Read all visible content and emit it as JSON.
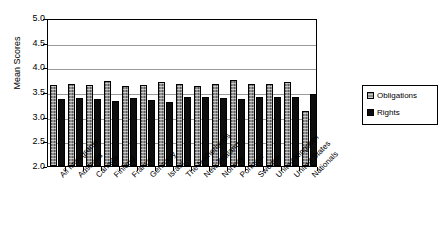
{
  "chart_data": {
    "type": "bar",
    "title": "",
    "xlabel": "",
    "ylabel": "Mean Scores",
    "ylim": [
      2.0,
      5.0
    ],
    "ytick_labels": [
      "5.0",
      "4.5",
      "4.0",
      "3.5",
      "3.0",
      "2.5",
      "2.0"
    ],
    "ytick_values": [
      5.0,
      4.5,
      4.0,
      3.5,
      3.0,
      2.5,
      2.0
    ],
    "grid": true,
    "legend_position": "right",
    "categories": [
      "All Immigrants",
      "Australia",
      "Canada",
      "Finland",
      "France",
      "Germany",
      "Israel",
      "The Netherlands",
      "New Zealand",
      "Norway",
      "Portugal",
      "Sweden",
      "United Kingdom",
      "United States",
      "Nationals"
    ],
    "series": [
      {
        "name": "Obligations",
        "color": "#8f8f8f",
        "values": [
          3.65,
          3.66,
          3.64,
          3.72,
          3.62,
          3.64,
          3.7,
          3.66,
          3.63,
          3.67,
          3.74,
          3.67,
          3.66,
          3.7,
          3.11
        ]
      },
      {
        "name": "Rights",
        "color": "#0d0d0d",
        "values": [
          3.35,
          3.37,
          3.35,
          3.32,
          3.38,
          3.34,
          3.3,
          3.39,
          3.39,
          3.38,
          3.35,
          3.39,
          3.39,
          3.39,
          3.45
        ]
      }
    ]
  },
  "legend": {
    "items": [
      {
        "label": "Obligations",
        "swatch": "obligations"
      },
      {
        "label": "Rights",
        "swatch": "rights"
      }
    ]
  }
}
